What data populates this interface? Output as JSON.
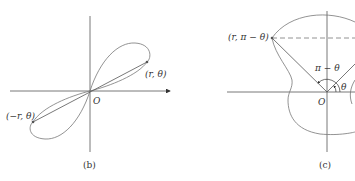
{
  "figures": [
    {
      "id": "b",
      "caption": "(b)",
      "origin_label": "O",
      "point_1_label": "(r, θ)",
      "point_2_label": "(−r, θ)"
    },
    {
      "id": "c",
      "caption": "(c)",
      "origin_label": "O",
      "point_label": "(r, π − θ)",
      "angle_label_large": "π − θ",
      "angle_label_small": "θ"
    }
  ],
  "colors": {
    "stroke": "#555555",
    "curve": "#777777",
    "text": "#333333"
  }
}
